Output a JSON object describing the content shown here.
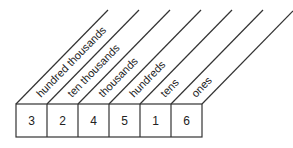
{
  "diagram": {
    "columns": [
      {
        "label": "hundred thousands",
        "digit": "3"
      },
      {
        "label": "ten thousands",
        "digit": "2"
      },
      {
        "label": "thousands",
        "digit": "4"
      },
      {
        "label": "hundreds",
        "digit": "5"
      },
      {
        "label": "tens",
        "digit": "1"
      },
      {
        "label": "ones",
        "digit": "6"
      }
    ],
    "colors": {
      "line": "#333333",
      "text": "#222222"
    }
  }
}
